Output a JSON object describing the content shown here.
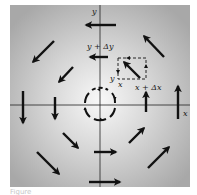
{
  "figure": {
    "type": "vector-field-diagram",
    "axes": {
      "x_label": "x",
      "y_label": "y"
    },
    "element_labels": {
      "y_plus_dy": "y + Δy",
      "y": "y",
      "x": "x",
      "x_plus_dx": "x + Δx"
    },
    "colors": {
      "background_center": "#f7f7f7",
      "background_edge": "#a9a9a9",
      "ink": "#111111",
      "frame": "#ffffff"
    },
    "caption_partial": "Figure"
  }
}
